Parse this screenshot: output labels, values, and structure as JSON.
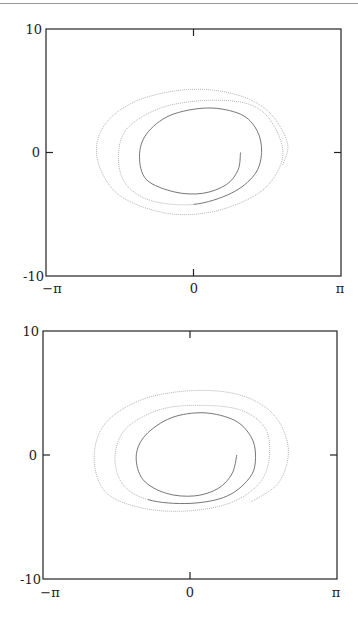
{
  "chart_data": [
    {
      "type": "line",
      "title": "",
      "xlabel": "",
      "ylabel": "",
      "xlim": [
        -3.14159,
        3.14159
      ],
      "ylim": [
        -10,
        10
      ],
      "grid": false,
      "legend": null,
      "x_ticks": [
        "-π",
        "0",
        "π"
      ],
      "y_ticks": [
        "10",
        "0",
        "-10"
      ],
      "description": "Phase portrait: trajectory spiralling outward from approx (1.0, 0) in (angle, velocity) space over about 3.5 revolutions",
      "series": [
        {
          "name": "trajectory",
          "style": "gray dotted",
          "x": [
            1.0,
            0.95,
            0.7,
            0.2,
            -0.4,
            -1.0,
            -1.15,
            -1.0,
            -0.5,
            0.3,
            1.0,
            1.35,
            1.45,
            1.3,
            0.8,
            0.0,
            -0.9,
            -1.45,
            -1.6,
            -1.4,
            -0.7,
            0.2,
            1.1,
            1.6,
            1.9,
            1.75,
            1.3,
            0.4,
            -0.6,
            -1.6,
            -2.05,
            -1.9,
            -1.2,
            -0.1,
            0.9,
            1.6,
            2.0,
            1.9
          ],
          "y": [
            0.0,
            -1.4,
            -2.6,
            -3.3,
            -3.2,
            -2.2,
            -0.3,
            1.5,
            3.0,
            3.6,
            3.1,
            1.8,
            0.0,
            -1.8,
            -3.3,
            -4.2,
            -3.9,
            -2.5,
            -0.2,
            2.0,
            3.6,
            4.2,
            4.0,
            2.8,
            0.3,
            -1.8,
            -3.5,
            -4.8,
            -4.9,
            -3.4,
            -0.5,
            2.2,
            4.2,
            5.1,
            4.7,
            3.3,
            0.8,
            -1.0
          ]
        }
      ]
    },
    {
      "type": "line",
      "title": "",
      "xlabel": "",
      "ylabel": "",
      "xlim": [
        -3.14159,
        3.14159
      ],
      "ylim": [
        -10,
        10
      ],
      "grid": false,
      "legend": null,
      "x_ticks": [
        "-π",
        "0",
        "π"
      ],
      "y_ticks": [
        "10",
        "0",
        "-10"
      ],
      "description": "Phase portrait: trajectory spiralling outward from approx (1.0, 0) with smoother, more elliptical outer loops",
      "series": [
        {
          "name": "trajectory",
          "style": "gray dotted",
          "x": [
            1.0,
            0.9,
            0.6,
            0.1,
            -0.5,
            -1.0,
            -1.15,
            -0.95,
            -0.4,
            0.3,
            0.95,
            1.3,
            1.4,
            1.3,
            0.8,
            0.0,
            -0.9,
            -1.45,
            -1.6,
            -1.35,
            -0.6,
            0.3,
            1.1,
            1.6,
            1.7,
            1.5,
            0.9,
            0.0,
            -1.0,
            -1.8,
            -2.05,
            -1.8,
            -1.0,
            0.1,
            1.1,
            1.8,
            2.1,
            1.9,
            1.3
          ],
          "y": [
            0.0,
            -1.5,
            -2.7,
            -3.3,
            -3.1,
            -2.0,
            -0.1,
            1.6,
            3.0,
            3.4,
            2.8,
            1.5,
            0.0,
            -1.7,
            -3.3,
            -3.9,
            -3.6,
            -2.3,
            0.0,
            2.2,
            3.7,
            4.0,
            3.6,
            2.2,
            0.0,
            -2.2,
            -3.8,
            -4.5,
            -4.3,
            -3.0,
            -0.2,
            2.6,
            4.5,
            5.2,
            4.8,
            3.2,
            0.5,
            -2.2,
            -3.8
          ]
        }
      ]
    }
  ],
  "panels": [
    {
      "y_top_label": "10",
      "y_mid_label": "0",
      "y_bot_label": "-10",
      "x_left_label": "−π",
      "x_mid_label": "0",
      "x_right_label": "π"
    },
    {
      "y_top_label": "10",
      "y_mid_label": "0",
      "y_bot_label": "-10",
      "x_left_label": "−π",
      "x_mid_label": "0",
      "x_right_label": "π"
    }
  ],
  "colors": {
    "axes": "#222222",
    "curve_inner": "#666666",
    "curve_outer": "#aaaaaa"
  }
}
